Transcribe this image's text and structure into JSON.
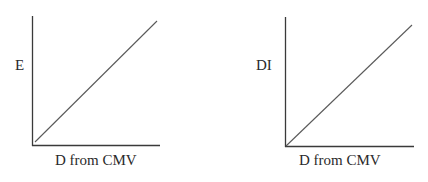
{
  "figure": {
    "panels": [
      {
        "id": "left",
        "y_label": "E",
        "x_label": "D from CMV",
        "relationship": "linear increasing"
      },
      {
        "id": "right",
        "y_label": "DI",
        "x_label": "D from CMV",
        "relationship": "linear increasing"
      }
    ],
    "colors": {
      "axis": "#3a3a3a",
      "line": "#5a5a5a",
      "text": "#2a2a2a",
      "background": "#ffffff"
    }
  }
}
